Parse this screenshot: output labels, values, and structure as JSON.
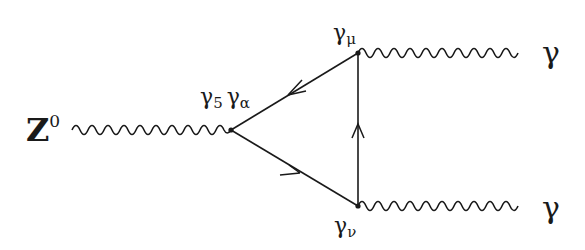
{
  "diagram": {
    "type": "feynman-triangle",
    "colors": {
      "ink": "#1a1a1a",
      "background": "#ffffff"
    },
    "vertices": {
      "left": {
        "x": 231,
        "y": 130
      },
      "top": {
        "x": 358,
        "y": 53
      },
      "bottom": {
        "x": 358,
        "y": 206
      }
    },
    "labels": {
      "z_boson": "Z",
      "z_superscript": "0",
      "left_vertex_g5": "γ",
      "left_vertex_g5_sub": "5",
      "left_vertex_ga": "γ",
      "left_vertex_ga_sub": "α",
      "top_vertex": "γ",
      "top_vertex_sub": "μ",
      "bottom_vertex": "γ",
      "bottom_vertex_sub": "ν",
      "photon_top": "γ",
      "photon_bottom": "γ"
    },
    "edges": [
      {
        "name": "z-boson-line",
        "kind": "wavy",
        "from": [
          70,
          130
        ],
        "to": [
          231,
          130
        ]
      },
      {
        "name": "photon-top-line",
        "kind": "wavy",
        "from": [
          358,
          53
        ],
        "to": [
          517,
          53
        ]
      },
      {
        "name": "photon-bottom-line",
        "kind": "wavy",
        "from": [
          358,
          206
        ],
        "to": [
          517,
          206
        ]
      },
      {
        "name": "fermion-top-left",
        "kind": "fermion",
        "arrow": "toward-left"
      },
      {
        "name": "fermion-left-bottom",
        "kind": "fermion",
        "arrow": "toward-bottom"
      },
      {
        "name": "fermion-bottom-top",
        "kind": "fermion",
        "arrow": "upward"
      }
    ]
  }
}
